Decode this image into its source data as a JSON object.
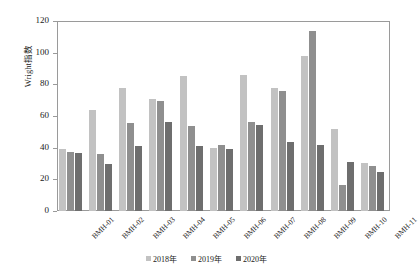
{
  "chart_data": {
    "type": "bar",
    "title": "",
    "xlabel": "",
    "ylabel": "Wright指数",
    "ylim": [
      0,
      120
    ],
    "yticks": [
      0,
      20,
      40,
      60,
      80,
      100,
      120
    ],
    "grid": false,
    "legend_position": "bottom-center",
    "categories": [
      "BMH-01",
      "BMH-02",
      "BMH-03",
      "BMH-04",
      "BMH-05",
      "BMH-06",
      "BMH-07",
      "BMH-08",
      "BMH-09",
      "BMH-10",
      "BMH-11"
    ],
    "series": [
      {
        "name": "2018年",
        "color": "#c2c2c2",
        "values": [
          39,
          63.5,
          77.5,
          71,
          85.5,
          40,
          86,
          78,
          98,
          52,
          30.5
        ]
      },
      {
        "name": "2019年",
        "color": "#8f8f8f",
        "values": [
          37.5,
          36,
          55.5,
          69.5,
          53.5,
          42,
          56,
          76,
          113.5,
          16.5,
          28.5
        ]
      },
      {
        "name": "2020年",
        "color": "#6e6e6e",
        "values": [
          36.5,
          30,
          41,
          56.5,
          41,
          39,
          54.5,
          43.5,
          41.5,
          31,
          24.5
        ]
      }
    ]
  },
  "axis": {
    "y_tick_labels": [
      "0",
      "20",
      "40",
      "60",
      "80",
      "100",
      "120"
    ]
  },
  "legend": {
    "items": [
      {
        "label": "2018年",
        "color": "#c2c2c2"
      },
      {
        "label": "2019年",
        "color": "#8f8f8f"
      },
      {
        "label": "2020年",
        "color": "#6e6e6e"
      }
    ]
  }
}
